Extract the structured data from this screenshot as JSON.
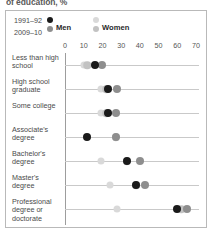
{
  "clipped_caption": "of education, %",
  "legend": {
    "year_old": "1991–92",
    "year_new": "2009–10",
    "series_men": "Men",
    "series_women": "Women",
    "color_men_old": "#1a1a1a",
    "color_men_new": "#8e8e8e",
    "color_women_old": "#d9d9d9",
    "color_women_new": "#c2c2c2"
  },
  "chart_data": {
    "type": "scatter",
    "title": "of education, %",
    "xlabel": "",
    "ylabel": "",
    "xlim": [
      0,
      75
    ],
    "xticks": [
      0,
      10,
      20,
      30,
      40,
      50,
      60,
      70
    ],
    "grid": false,
    "legend_position": "top-left",
    "categories": [
      "Less than high school",
      "High school graduate",
      "Some college",
      "Associate's degree",
      "Bachelor's degree",
      "Master's degree",
      "Professional degree or doctorate"
    ],
    "series": [
      {
        "name": "1991–92 Men",
        "color": "#1a1a1a",
        "values": [
          16,
          23,
          23,
          12,
          33,
          38,
          60
        ]
      },
      {
        "name": "2009–10 Men",
        "color": "#8e8e8e",
        "values": [
          20,
          28,
          27,
          27,
          40,
          43,
          65
        ]
      },
      {
        "name": "1991–92 Women",
        "color": "#d9d9d9",
        "values": [
          10,
          19,
          19,
          12,
          19,
          24,
          28
        ]
      },
      {
        "name": "2009–10 Women",
        "color": "#c2c2c2",
        "values": [
          12,
          22,
          22,
          27,
          33,
          38,
          62
        ]
      }
    ]
  }
}
